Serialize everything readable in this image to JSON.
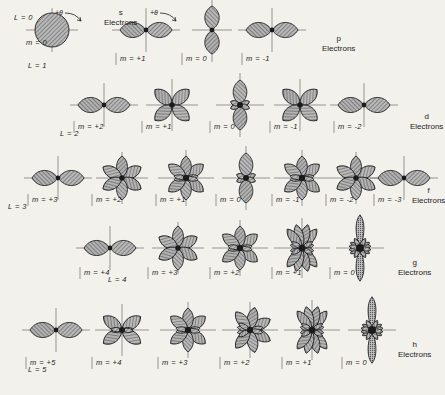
{
  "figure": {
    "background_color": "#f3f1ec",
    "ink_color": "#1d1d1d",
    "lobe_fill": "#8d8d8d",
    "axis_color": "#6e6e6e",
    "angle_annotation": "+θ"
  },
  "rows": [
    {
      "id": "s",
      "shell_letter": "s",
      "shell_word": "Electrons",
      "l_label": "L = 0",
      "orbitals": [
        {
          "m_label": "m = 0",
          "shape": "sphere",
          "lobes": 1
        }
      ]
    },
    {
      "id": "p",
      "shell_letter": "p",
      "shell_word": "Electrons",
      "l_label": "L = 1",
      "orbitals": [
        {
          "m_label": "m = +1",
          "shape": "horizontal-dumbbell",
          "lobes": 2
        },
        {
          "m_label": "m = 0",
          "shape": "vertical-dumbbell",
          "lobes": 2
        },
        {
          "m_label": "m = -1",
          "shape": "horizontal-dumbbell",
          "lobes": 2
        }
      ]
    },
    {
      "id": "d",
      "shell_letter": "d",
      "shell_word": "Electrons",
      "l_label": "L = 2",
      "orbitals": [
        {
          "m_label": "m = +2",
          "shape": "horizontal-dumbbell",
          "lobes": 2
        },
        {
          "m_label": "m = +1",
          "shape": "cloverleaf",
          "lobes": 4
        },
        {
          "m_label": "m = 0",
          "shape": "vertical-dumbbell-collar",
          "lobes": 2
        },
        {
          "m_label": "m = -1",
          "shape": "cloverleaf",
          "lobes": 4
        },
        {
          "m_label": "m = -2",
          "shape": "horizontal-dumbbell",
          "lobes": 2
        }
      ]
    },
    {
      "id": "f",
      "shell_letter": "f",
      "shell_word": "Electrons",
      "l_label": "L = 3",
      "orbitals": [
        {
          "m_label": "m = +3",
          "shape": "horizontal-dumbbell",
          "lobes": 2
        },
        {
          "m_label": "m = +2",
          "shape": "six-lobe",
          "lobes": 6
        },
        {
          "m_label": "m = +1",
          "shape": "six-lobe-collar",
          "lobes": 6
        },
        {
          "m_label": "m = 0",
          "shape": "vertical-dumbbell-collar",
          "lobes": 2
        },
        {
          "m_label": "m = -1",
          "shape": "six-lobe-collar",
          "lobes": 6
        },
        {
          "m_label": "m = -2",
          "shape": "six-lobe",
          "lobes": 6
        },
        {
          "m_label": "m = -3",
          "shape": "horizontal-dumbbell",
          "lobes": 2
        }
      ]
    },
    {
      "id": "g",
      "shell_letter": "g",
      "shell_word": "Electrons",
      "l_label": "L = 4",
      "orbitals": [
        {
          "m_label": "m = +4",
          "shape": "horizontal-dumbbell",
          "lobes": 2
        },
        {
          "m_label": "m = +3",
          "shape": "six-lobe",
          "lobes": 6
        },
        {
          "m_label": "m = +2",
          "shape": "six-lobe-collar",
          "lobes": 6
        },
        {
          "m_label": "m = +1",
          "shape": "eight-lobe",
          "lobes": 8
        },
        {
          "m_label": "m = 0",
          "shape": "vertical-spike",
          "lobes": 2
        }
      ]
    },
    {
      "id": "h",
      "shell_letter": "h",
      "shell_word": "Electrons",
      "l_label": "L = 5",
      "orbitals": [
        {
          "m_label": "m = +5",
          "shape": "horizontal-dumbbell",
          "lobes": 2
        },
        {
          "m_label": "m = +4",
          "shape": "four-lobe-x",
          "lobes": 4
        },
        {
          "m_label": "m = +3",
          "shape": "six-lobe-collar",
          "lobes": 6
        },
        {
          "m_label": "m = +2",
          "shape": "six-lobe-spread",
          "lobes": 6
        },
        {
          "m_label": "m = +1",
          "shape": "eight-lobe",
          "lobes": 8
        },
        {
          "m_label": "m = 0",
          "shape": "vertical-spike",
          "lobes": 2
        }
      ]
    }
  ]
}
